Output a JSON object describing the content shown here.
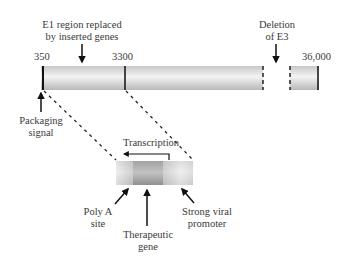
{
  "diagram": {
    "title_labels": {
      "e1_region": [
        "E1 region replaced",
        "by inserted genes"
      ],
      "deletion_e3": [
        "Deletion",
        "of E3"
      ]
    },
    "positions": {
      "start": "350",
      "e1_end": "3300",
      "genome_end": "36,000"
    },
    "annotations": {
      "packaging_signal": [
        "Packaging",
        "signal"
      ],
      "transcription": "Transcription",
      "poly_a_site": [
        "Poly A",
        "site"
      ],
      "therapeutic_gene": [
        "Therapeutic",
        "gene"
      ],
      "strong_viral_promoter": [
        "Strong viral",
        "promoter"
      ]
    },
    "colors": {
      "bar_light": "#f2f2f2",
      "bar_mid": "#cfcfcf",
      "gene_dark": "#8a8a8a",
      "line": "#111111"
    }
  }
}
